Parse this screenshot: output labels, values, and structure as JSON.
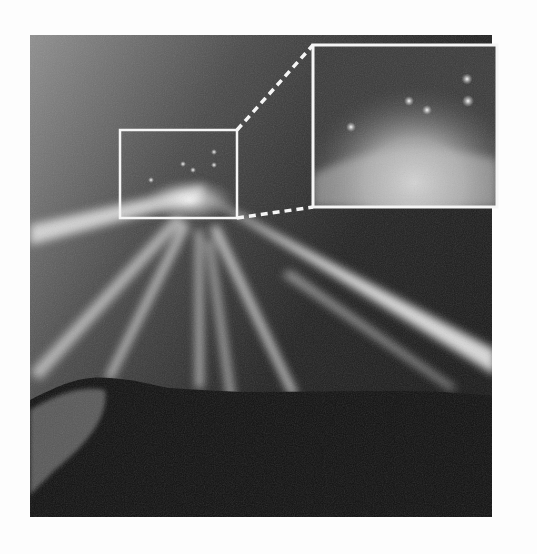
{
  "figure": {
    "photo": {
      "x": 30,
      "y": 35,
      "width": 462,
      "height": 482
    },
    "highlight_box": {
      "x": 120,
      "y": 130,
      "width": 117,
      "height": 88
    },
    "inset": {
      "x": 313,
      "y": 45,
      "width": 184,
      "height": 162
    },
    "colors": {
      "background": "#fdfdfd",
      "sky_light": "#8a8a8a",
      "sky_dark": "#1e1e1e",
      "ground": "#0e0e0e",
      "beam": "#f2f2f2",
      "frame": "#f5f5f5"
    },
    "lights_main": [
      {
        "x": 151,
        "y": 180
      },
      {
        "x": 183,
        "y": 164
      },
      {
        "x": 193,
        "y": 170
      },
      {
        "x": 214,
        "y": 152
      },
      {
        "x": 214,
        "y": 165
      }
    ],
    "lights_inset": [
      {
        "x": 351,
        "y": 127
      },
      {
        "x": 409,
        "y": 101
      },
      {
        "x": 427,
        "y": 110
      },
      {
        "x": 467,
        "y": 79
      },
      {
        "x": 468,
        "y": 101
      }
    ]
  }
}
